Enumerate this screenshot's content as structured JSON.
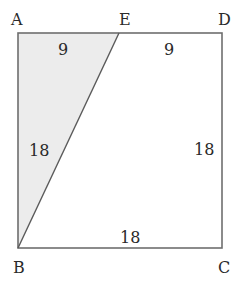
{
  "diagram": {
    "type": "geometry",
    "shape": "square ABCD with segment BE, triangle ABE shaded",
    "colors": {
      "stroke": "#6e6e6e",
      "shade": "#ececec",
      "text": "#2a2a2a"
    },
    "vertices": {
      "A": {
        "label": "A"
      },
      "B": {
        "label": "B"
      },
      "C": {
        "label": "C"
      },
      "D": {
        "label": "D"
      },
      "E": {
        "label": "E"
      }
    },
    "measurements": {
      "AE": "9",
      "ED": "9",
      "AB": "18",
      "DC": "18",
      "BC": "18"
    }
  }
}
